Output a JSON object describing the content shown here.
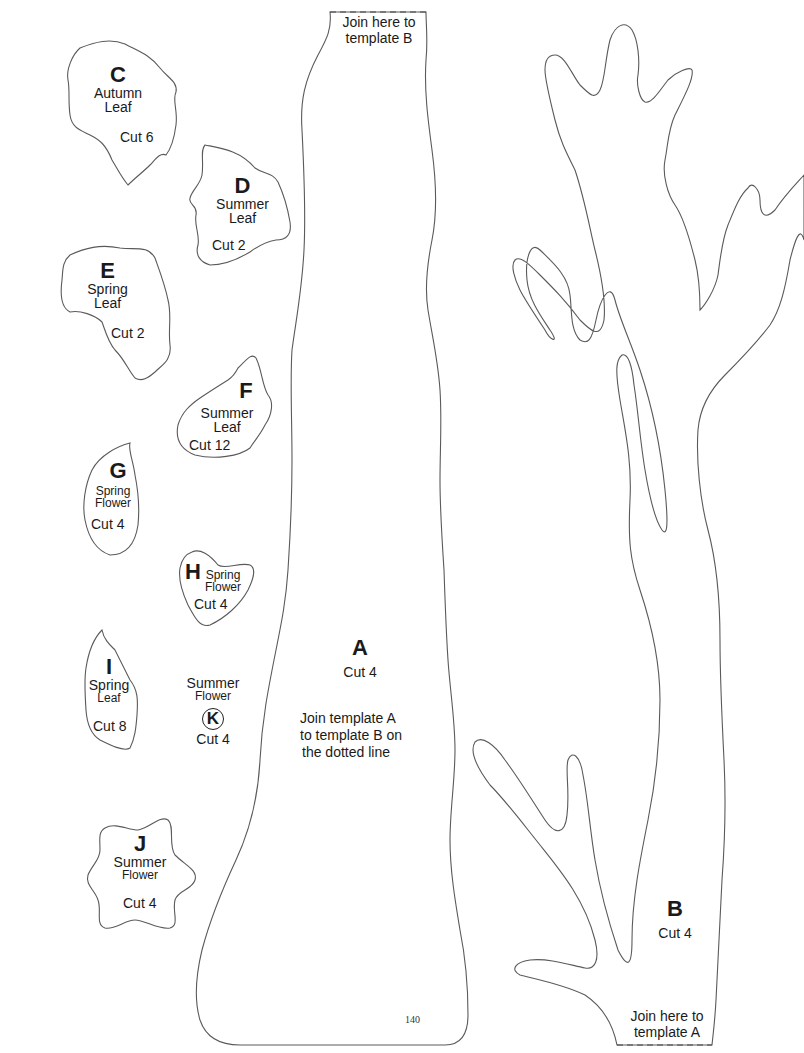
{
  "page": {
    "page_number": "140",
    "line_color": "#5a5a5a",
    "background": "#ffffff"
  },
  "templates": {
    "A": {
      "letter": "A",
      "cut": "Cut 4",
      "join_top": [
        "Join here to",
        "template B"
      ],
      "instructions": [
        "Join template A",
        "to template B on",
        "the dotted line"
      ]
    },
    "B": {
      "letter": "B",
      "cut": "Cut 4",
      "join_bottom": [
        "Join here to",
        "template A"
      ]
    },
    "C": {
      "letter": "C",
      "name": [
        "Autumn",
        "Leaf"
      ],
      "cut": "Cut 6"
    },
    "D": {
      "letter": "D",
      "name": [
        "Summer",
        "Leaf"
      ],
      "cut": "Cut 2"
    },
    "E": {
      "letter": "E",
      "name": [
        "Spring",
        "Leaf"
      ],
      "cut": "Cut 2"
    },
    "F": {
      "letter": "F",
      "name": [
        "Summer",
        "Leaf"
      ],
      "cut": "Cut 12"
    },
    "G": {
      "letter": "G",
      "name": [
        "Spring",
        "Flower"
      ],
      "cut": "Cut 4"
    },
    "H": {
      "letter": "H",
      "name": [
        "Spring",
        "Flower"
      ],
      "cut": "Cut 4"
    },
    "I": {
      "letter": "I",
      "name": [
        "Spring",
        "Leaf"
      ],
      "cut": "Cut 8"
    },
    "J": {
      "letter": "J",
      "name": [
        "Summer",
        "Flower"
      ],
      "cut": "Cut 4"
    },
    "K": {
      "letter": "K",
      "name": [
        "Summer",
        "Flower"
      ],
      "cut": "Cut 4"
    }
  }
}
